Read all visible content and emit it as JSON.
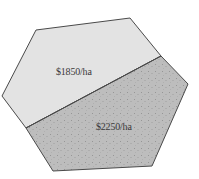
{
  "diagram": {
    "type": "land-parcel-hexagon",
    "regions": [
      {
        "id": "upper",
        "label": "$1850/ha",
        "fill": "#e3e3e3",
        "pattern": "none",
        "polygon": [
          [
            36,
            30
          ],
          [
            130,
            18
          ],
          [
            161,
            56
          ],
          [
            26,
            128
          ],
          [
            2,
            96
          ]
        ]
      },
      {
        "id": "lower",
        "label": "$2250/ha",
        "fill": "#bdbdbd",
        "pattern": "stipple",
        "polygon": [
          [
            26,
            128
          ],
          [
            161,
            56
          ],
          [
            188,
            84
          ],
          [
            152,
            166
          ],
          [
            53,
            171
          ]
        ]
      }
    ],
    "outline_color": "#4a4a4a",
    "divider": [
      [
        26,
        128
      ],
      [
        161,
        56
      ]
    ]
  }
}
